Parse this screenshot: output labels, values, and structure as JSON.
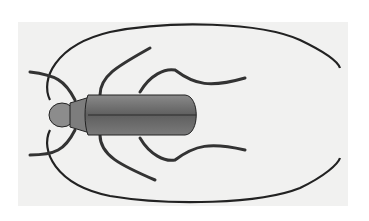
{
  "image": {
    "subject": "longhorn beetle engraving, dorsal view",
    "background_color": "#ffffff",
    "plate_color": "#f1f1f0",
    "body_color": "#6f6f6f",
    "outline_color": "#222222"
  }
}
